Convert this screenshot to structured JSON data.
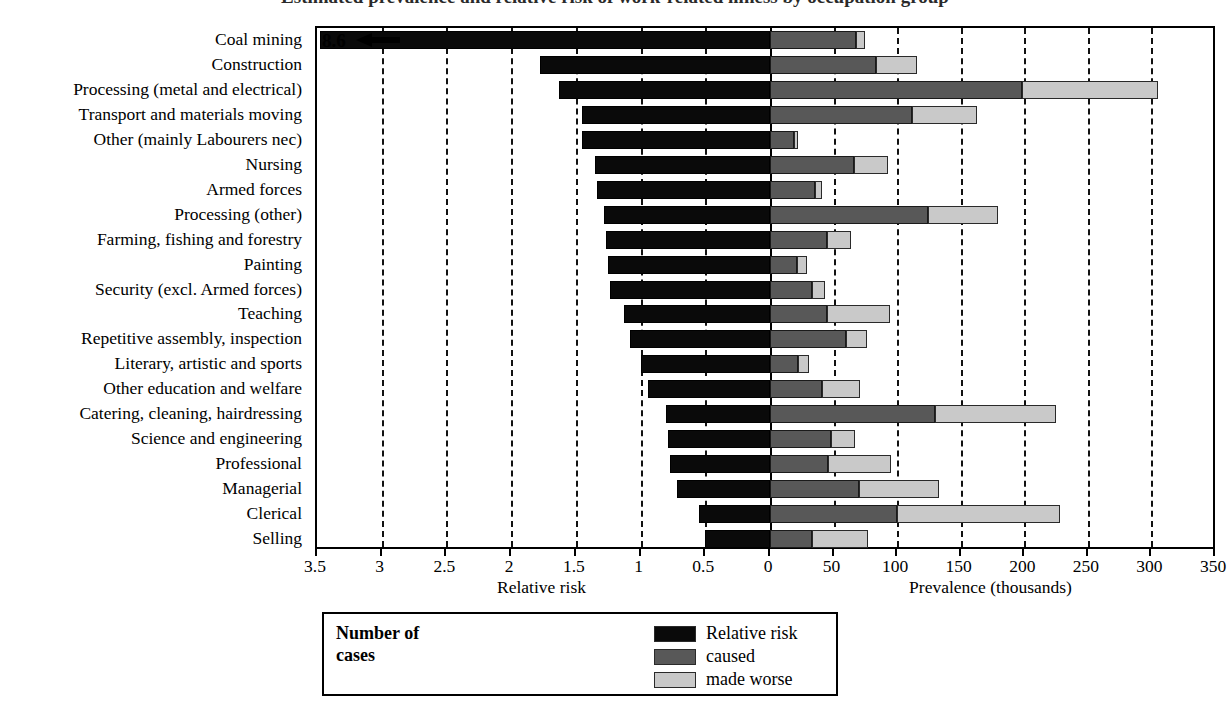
{
  "title": "Estimated prevalence and relative risk of work-related illness by occupation group",
  "axes": {
    "left_title": "Relative risk",
    "right_title": "Prevalence (thousands)",
    "left_ticks": [
      "3.5",
      "3",
      "2.5",
      "2",
      "1.5",
      "1",
      "0.5",
      "0"
    ],
    "left_tick_values": [
      3.5,
      3,
      2.5,
      2,
      1.5,
      1,
      0.5,
      0
    ],
    "right_ticks": [
      "0",
      "50",
      "100",
      "150",
      "200",
      "250",
      "300",
      "350"
    ],
    "right_tick_values": [
      0,
      50,
      100,
      150,
      200,
      250,
      300,
      350
    ]
  },
  "offscale": {
    "label": "8.6",
    "icon": "left-arrow-icon"
  },
  "legend": {
    "title_line1": "Number of",
    "title_line2": "cases",
    "items": [
      {
        "label": "Relative risk",
        "color": "#0a0a0a"
      },
      {
        "label": "caused",
        "color": "#585858"
      },
      {
        "label": "made worse",
        "color": "#c9c9c9"
      }
    ]
  },
  "chart_data": {
    "type": "bar",
    "title": "Estimated prevalence and relative risk of work-related illness by occupation group",
    "orientation": "horizontal",
    "layout": "bidirectional (relative risk leftwards, prevalence rightwards)",
    "grid": true,
    "legend_position": "bottom",
    "left_axis": {
      "label": "Relative risk",
      "range": [
        3.5,
        0
      ],
      "ticks": [
        3.5,
        3,
        2.5,
        2,
        1.5,
        1,
        0.5,
        0
      ],
      "direction": "right-to-left"
    },
    "right_axis": {
      "label": "Prevalence (thousands)",
      "range": [
        0,
        350
      ],
      "ticks": [
        0,
        50,
        100,
        150,
        200,
        250,
        300,
        350
      ]
    },
    "categories": [
      "Coal mining",
      "Construction",
      "Processing (metal and electrical)",
      "Transport and materials moving",
      "Other (mainly Labourers nec)",
      "Nursing",
      "Armed forces",
      "Processing (other)",
      "Farming, fishing and forestry",
      "Painting",
      "Security (excl. Armed forces)",
      "Teaching",
      "Repetitive assembly, inspection",
      "Literary, artistic and sports",
      "Other education and welfare",
      "Catering, cleaning, hairdressing",
      "Science and engineering",
      "Professional",
      "Managerial",
      "Clerical",
      "Selling"
    ],
    "series": [
      {
        "name": "Relative risk",
        "color": "#0a0a0a",
        "axis": "left",
        "values": [
          8.6,
          1.78,
          1.63,
          1.45,
          1.45,
          1.35,
          1.34,
          1.28,
          1.27,
          1.25,
          1.24,
          1.13,
          1.08,
          1.0,
          0.94,
          0.8,
          0.79,
          0.77,
          0.72,
          0.55,
          0.5
        ],
        "offscale": [
          true,
          false,
          false,
          false,
          false,
          false,
          false,
          false,
          false,
          false,
          false,
          false,
          false,
          false,
          false,
          false,
          false,
          false,
          false,
          false,
          false
        ]
      },
      {
        "name": "caused",
        "color": "#585858",
        "axis": "right",
        "values": [
          68,
          83,
          198,
          112,
          19,
          66,
          35,
          124,
          45,
          21,
          33,
          45,
          60,
          22,
          41,
          130,
          48,
          46,
          70,
          100,
          33
        ]
      },
      {
        "name": "made worse",
        "color": "#c9c9c9",
        "axis": "right",
        "values": [
          7,
          33,
          107,
          51,
          3,
          27,
          6,
          55,
          19,
          8,
          10,
          49,
          16,
          9,
          30,
          95,
          19,
          49,
          63,
          128,
          44
        ]
      }
    ],
    "totals_prevalence": [
      75,
      116,
      305,
      163,
      22,
      93,
      41,
      179,
      64,
      29,
      43,
      94,
      76,
      31,
      71,
      225,
      67,
      95,
      133,
      228,
      77
    ]
  }
}
